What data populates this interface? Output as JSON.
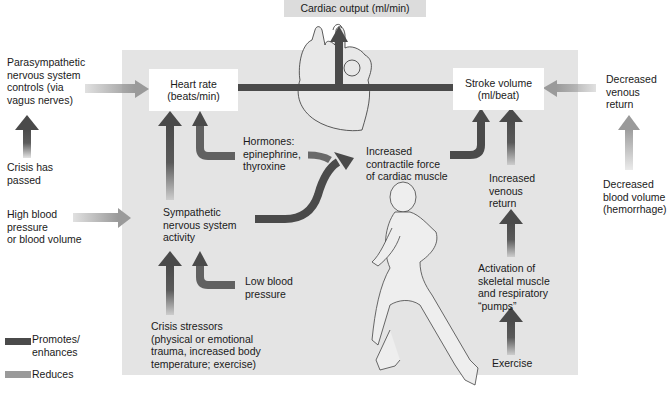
{
  "title": "Cardiac output (ml/min)",
  "nodes": {
    "heart_rate": {
      "line1": "Heart rate",
      "line2": "(beats/min)"
    },
    "stroke_volume": {
      "line1": "Stroke volume",
      "line2": "(ml/beat)"
    }
  },
  "labels": {
    "parasympathetic": [
      "Parasympathetic",
      "nervous system",
      "controls (via",
      "vagus nerves)"
    ],
    "crisis_passed": [
      "Crisis has",
      "passed"
    ],
    "high_bp": [
      "High blood",
      "pressure",
      "or blood volume"
    ],
    "hormones": [
      "Hormones:",
      "epinephrine,",
      "thyroxine"
    ],
    "contractile": [
      "Increased",
      "contractile force",
      "of cardiac muscle"
    ],
    "sympathetic": [
      "Sympathetic",
      "nervous system",
      "activity"
    ],
    "low_bp": [
      "Low blood",
      "pressure"
    ],
    "crisis_stressors": [
      "Crisis stressors",
      "(physical or emotional",
      "trauma, increased body",
      "temperature; exercise)"
    ],
    "increased_venous": [
      "Increased",
      "venous",
      "return"
    ],
    "activation": [
      "Activation of",
      "skeletal muscle",
      "and respiratory",
      "“pumps”"
    ],
    "exercise": [
      "Exercise"
    ],
    "decreased_venous": [
      "Decreased",
      "venous",
      "return"
    ],
    "decreased_blood_volume": [
      "Decreased",
      "blood volume",
      "(hemorrhage)"
    ]
  },
  "legend": {
    "promotes": [
      "Promotes/",
      "enhances"
    ],
    "reduces": [
      "Reduces"
    ]
  },
  "colors": {
    "promotes": "#4a4a4a",
    "reduces": "#9a9a9a",
    "panel": "#e4e4e4"
  }
}
